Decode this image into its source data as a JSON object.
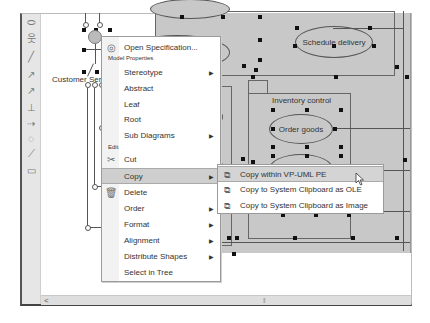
{
  "toolbar": {
    "tools": [
      {
        "name": "use-case-tool",
        "glyph": "⬭"
      },
      {
        "name": "actor-tool",
        "glyph": "웃"
      },
      {
        "name": "association-tool",
        "glyph": "╱"
      },
      {
        "name": "include-tool",
        "glyph": "↗"
      },
      {
        "name": "extend-tool",
        "glyph": "↗"
      },
      {
        "name": "generalization-tool",
        "glyph": "⊥"
      },
      {
        "name": "realization-tool",
        "glyph": "⇢"
      },
      {
        "name": "package-tool",
        "glyph": "◌"
      },
      {
        "name": "anchor-tool",
        "glyph": "⟋"
      },
      {
        "name": "rectangle-tool",
        "glyph": "▭"
      }
    ]
  },
  "diagram": {
    "actor_label": "Customer Servi",
    "elements": {
      "goods_return": "oods return",
      "schedule_delivery": "Schedule delivery",
      "membership_package": "nbership",
      "membership_record": "nbership record",
      "inventory_control": "Inventory control",
      "order_goods": "Order goods",
      "new_member": "new member",
      "deliver_goods": "Deliver goods"
    }
  },
  "context_menu": {
    "open_spec": "Open Specification...",
    "section_model": "Model Properties",
    "stereotype": "Stereotype",
    "abstract": "Abstract",
    "leaf": "Leaf",
    "root": "Root",
    "sub_diagrams": "Sub Diagrams",
    "section_edit": "Edit",
    "cut": "Cut",
    "copy": "Copy",
    "delete": "Delete",
    "order": "Order",
    "format": "Format",
    "alignment": "Alignment",
    "distribute_shapes": "Distribute Shapes",
    "select_in_tree": "Select in Tree",
    "submenu_arrow": "▶"
  },
  "copy_submenu": {
    "items": [
      {
        "label": "Copy within VP-UML PE",
        "highlighted": true
      },
      {
        "label": "Copy to System Clipboard as OLE",
        "highlighted": false
      },
      {
        "label": "Copy to System Clipboard as Image",
        "highlighted": false
      }
    ]
  },
  "scrollbar": {
    "left_arrow": "<",
    "grip": "|||"
  }
}
